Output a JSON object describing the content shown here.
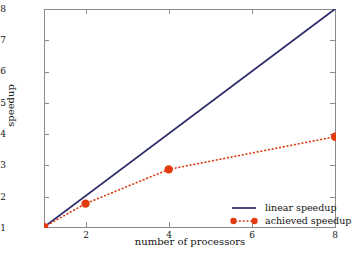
{
  "chart_data": {
    "type": "line",
    "title": "",
    "xlabel": "number of processors",
    "ylabel": "speedup",
    "xlim": [
      1,
      8
    ],
    "ylim": [
      1,
      8
    ],
    "xticks": [
      2,
      4,
      6,
      8
    ],
    "yticks": [
      1,
      2,
      3,
      4,
      5,
      6,
      7,
      8
    ],
    "xtick_labels": [
      "2",
      "4",
      "6",
      "8"
    ],
    "ytick_labels": [
      "1",
      "2",
      "3",
      "4",
      "5",
      "6",
      "7",
      "8"
    ],
    "grid": false,
    "legend_position": "lower right (inside axes)",
    "series": [
      {
        "name": "linear speedup",
        "style": "solid line, no markers",
        "color": "#2a2a6a",
        "x": [
          1,
          8
        ],
        "values": [
          1,
          8
        ]
      },
      {
        "name": "achieved speedup",
        "style": "dotted line with round markers",
        "color": "#e03c10",
        "x": [
          1,
          2,
          4,
          8
        ],
        "values": [
          1,
          1.75,
          2.85,
          3.9
        ]
      }
    ]
  },
  "legend": {
    "entries": [
      {
        "label": "linear speedup",
        "marker": "solid-line-key",
        "color": "#2a2a6a"
      },
      {
        "label": "achieved speedup",
        "marker": "dotted-line-with-dots-key",
        "color": "#e03c10"
      }
    ]
  },
  "colors": {
    "linear": "#2a2a6a",
    "achieved": "#e03c10",
    "axis": "#8a8a8a",
    "text": "#141414",
    "background": "#ffffff"
  }
}
